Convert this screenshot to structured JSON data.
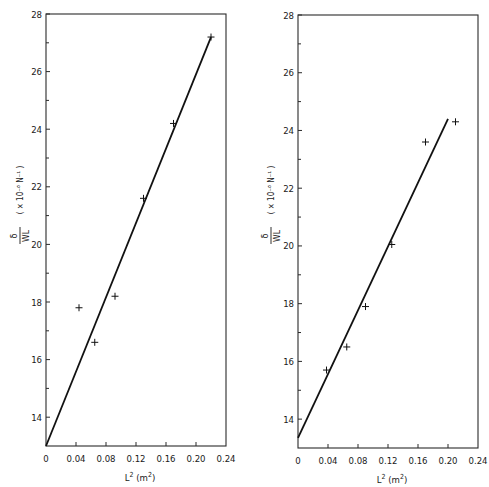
{
  "chart_data": [
    {
      "type": "scatter",
      "title": "",
      "xlabel": "L² (m²)",
      "ylabel": "δ / WL  (× 10⁻⁶ N⁻¹)",
      "xlim": [
        0,
        0.24
      ],
      "ylim": [
        13,
        28
      ],
      "xticks": [
        "0",
        "0.04",
        "0.08",
        "0.12",
        "0.16",
        "0.20",
        "0.24"
      ],
      "yticks": [
        "14",
        "16",
        "18",
        "20",
        "22",
        "24",
        "26",
        "28"
      ],
      "grid": false,
      "series": [
        {
          "name": "measured",
          "marker": "+",
          "x": [
            0.044,
            0.065,
            0.092,
            0.13,
            0.17,
            0.22
          ],
          "y": [
            17.8,
            16.6,
            18.2,
            21.6,
            24.2,
            27.2
          ]
        },
        {
          "name": "fit",
          "kind": "line",
          "x": [
            0,
            0.22
          ],
          "y": [
            13.0,
            27.2
          ]
        }
      ]
    },
    {
      "type": "scatter",
      "title": "",
      "xlabel": "L² (m²)",
      "ylabel": "δ / WL  (× 10⁻⁶ N⁻¹)",
      "xlim": [
        0,
        0.24
      ],
      "ylim": [
        13,
        28
      ],
      "xticks": [
        "0",
        "0.04",
        "0.08",
        "0.12",
        "0.16",
        "0.20",
        "0.24"
      ],
      "yticks": [
        "14",
        "16",
        "18",
        "20",
        "22",
        "24",
        "26",
        "28"
      ],
      "grid": false,
      "series": [
        {
          "name": "measured",
          "marker": "+",
          "x": [
            0.038,
            0.065,
            0.09,
            0.125,
            0.17,
            0.21
          ],
          "y": [
            15.7,
            16.5,
            17.9,
            20.05,
            23.6,
            24.3
          ]
        },
        {
          "name": "fit",
          "kind": "line",
          "x": [
            0,
            0.2
          ],
          "y": [
            13.35,
            24.4
          ]
        }
      ]
    }
  ],
  "labels": {
    "ylabel_num": "δ",
    "ylabel_den": "WL",
    "ylabel_units": "( × 10⁻⁶ N⁻¹ )",
    "xlabel_base": "L",
    "xlabel_sup": "2",
    "xlabel_units": "(m",
    "xlabel_units_sup": "2",
    "xlabel_close": ")"
  }
}
